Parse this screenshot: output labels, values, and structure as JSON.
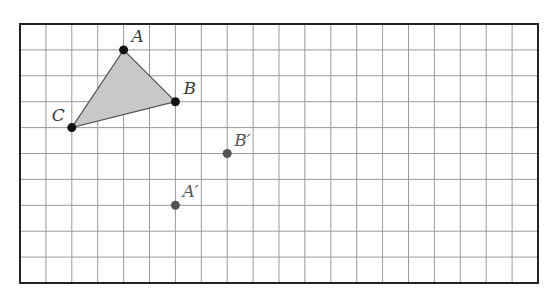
{
  "grid": {
    "columns": 20,
    "rows": 10,
    "origin_px": [
      20,
      24
    ],
    "cell_px": 25.9,
    "border_color": "#222222",
    "line_color": "#9a9a9a"
  },
  "triangle": {
    "fill": "#c8c8c8",
    "stroke": "#555555",
    "vertices": [
      "A",
      "B",
      "C"
    ]
  },
  "points": [
    {
      "name": "A",
      "label": "A",
      "col": 4,
      "row": 1,
      "color": "#111111",
      "label_dx": 8,
      "label_dy": -8
    },
    {
      "name": "B",
      "label": "B",
      "col": 6,
      "row": 3,
      "color": "#111111",
      "label_dx": 8,
      "label_dy": -8
    },
    {
      "name": "C",
      "label": "C",
      "col": 2,
      "row": 4,
      "color": "#111111",
      "label_dx": -20,
      "label_dy": -7
    },
    {
      "name": "B-prime",
      "label": "B′",
      "col": 8,
      "row": 5,
      "color": "#555555",
      "label_dx": 7,
      "label_dy": -8
    },
    {
      "name": "A-prime",
      "label": "A′",
      "col": 6,
      "row": 7,
      "color": "#555555",
      "label_dx": 7,
      "label_dy": -8
    }
  ]
}
